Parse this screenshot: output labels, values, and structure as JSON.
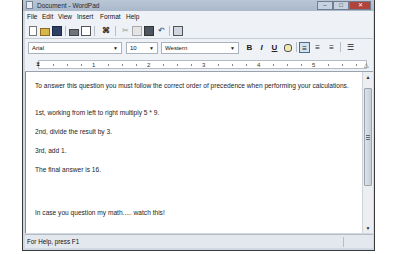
{
  "window": {
    "title": "Document - WordPad",
    "controls": {
      "minimize": "–",
      "maximize": "□",
      "close": "✕"
    }
  },
  "menubar": {
    "items": [
      {
        "label": "File"
      },
      {
        "label": "Edit"
      },
      {
        "label": "View"
      },
      {
        "label": "Insert"
      },
      {
        "label": "Format"
      },
      {
        "label": "Help"
      }
    ]
  },
  "toolbar": {
    "buttons": [
      {
        "name": "new-icon"
      },
      {
        "name": "open-icon"
      },
      {
        "name": "save-icon"
      },
      {
        "name": "print-icon"
      },
      {
        "name": "print-preview-icon"
      },
      {
        "name": "find-icon"
      },
      {
        "name": "cut-icon"
      },
      {
        "name": "copy-icon"
      },
      {
        "name": "paste-icon"
      },
      {
        "name": "undo-icon"
      },
      {
        "name": "insert-datetime-icon"
      }
    ]
  },
  "formatbar": {
    "font": "Arial",
    "size": "10",
    "script": "Western",
    "bold": "B",
    "italic": "I",
    "underline": "U",
    "color_icon": "color-icon",
    "align_left": "≡",
    "align_center": "≡",
    "align_right": "≡",
    "bullets": "☰",
    "dropdown_arrow": "▼"
  },
  "ruler": {
    "numbers": [
      "1",
      "2",
      "3",
      "4",
      "5"
    ]
  },
  "document": {
    "paragraphs": [
      "To answer this question you must follow the correct order of precedence when performing your calculations.",
      "1st, working from left to right multiply 5 * 9.",
      "2nd, divide the result by 3.",
      "3rd, add 1.",
      "The final answer is 16.",
      "In case you question my math..... watch this!"
    ]
  },
  "scrollbar": {
    "up": "▲",
    "down": "▼"
  },
  "statusbar": {
    "text": "For Help, press F1"
  },
  "colors": {
    "chrome": "#cfd8e3",
    "bar": "#eef1f5",
    "close": "#b0443a"
  }
}
